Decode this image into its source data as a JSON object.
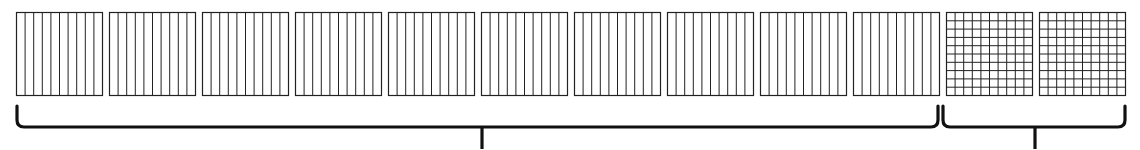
{
  "diagram": {
    "stroke_color": "#222222",
    "background": "#ffffff",
    "groups": [
      {
        "name": "rod-blocks",
        "count": 10,
        "kind": "vertical-lines",
        "divisions": 10,
        "brace": {
          "x1": 17,
          "x2": 938,
          "tick_x": 482
        }
      },
      {
        "name": "grid-blocks",
        "count": 2,
        "kind": "grid",
        "divisions": 10,
        "brace": {
          "x1": 943,
          "x2": 1125,
          "tick_x": 1035
        }
      }
    ],
    "block_x_positions": [
      16,
      109,
      202,
      295,
      388,
      481,
      574,
      667,
      760,
      853,
      946,
      1039
    ],
    "block_size": {
      "width": 86,
      "height": 83,
      "top": 12
    }
  }
}
